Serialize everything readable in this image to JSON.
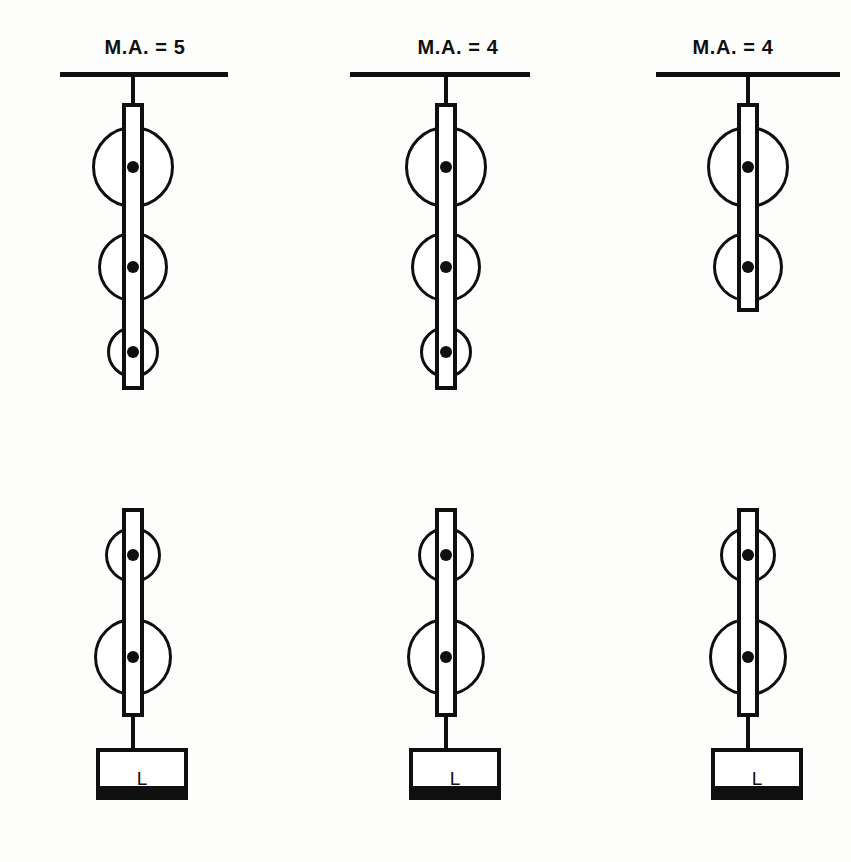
{
  "figure": {
    "type": "pulley-system-diagram",
    "background_color": "#fdfdfc",
    "line_color": "#100f0f",
    "columns": [
      {
        "id": "system-1",
        "label": "M.A. = 5",
        "mechanical_advantage": 5,
        "center_x": 133,
        "ceiling": {
          "x": 60,
          "width": 168,
          "y": 72
        },
        "top_block": {
          "sheave_count": 3,
          "sheave_diameters": [
            82,
            70,
            52
          ],
          "sheave_centers_y": [
            167,
            267,
            352
          ],
          "strap": {
            "top": 103,
            "bottom": 390,
            "width": 22
          }
        },
        "bottom_block": {
          "sheave_count": 2,
          "sheave_diameters": [
            56,
            78
          ],
          "sheave_centers_y": [
            555,
            657
          ],
          "strap": {
            "top": 508,
            "bottom": 717,
            "width": 22
          }
        },
        "load": {
          "label": "L",
          "box": {
            "x": 96,
            "y": 748,
            "width": 92,
            "height": 52
          },
          "base_height": 14
        }
      },
      {
        "id": "system-2",
        "label": "M.A. = 4",
        "mechanical_advantage": 4,
        "center_x": 446,
        "ceiling": {
          "x": 350,
          "width": 180,
          "y": 72
        },
        "top_block": {
          "sheave_count": 3,
          "sheave_diameters": [
            82,
            70,
            52
          ],
          "sheave_centers_y": [
            167,
            267,
            352
          ],
          "strap": {
            "top": 103,
            "bottom": 390,
            "width": 22
          }
        },
        "bottom_block": {
          "sheave_count": 2,
          "sheave_diameters": [
            56,
            78
          ],
          "sheave_centers_y": [
            555,
            657
          ],
          "strap": {
            "top": 508,
            "bottom": 717,
            "width": 22
          }
        },
        "load": {
          "label": "L",
          "box": {
            "x": 409,
            "y": 748,
            "width": 92,
            "height": 52
          },
          "base_height": 14
        }
      },
      {
        "id": "system-3",
        "label": "M.A. = 4",
        "mechanical_advantage": 4,
        "center_x": 748,
        "ceiling": {
          "x": 656,
          "width": 184,
          "y": 72
        },
        "top_block": {
          "sheave_count": 2,
          "sheave_diameters": [
            82,
            70
          ],
          "sheave_centers_y": [
            167,
            267
          ],
          "strap": {
            "top": 103,
            "bottom": 312,
            "width": 22
          }
        },
        "bottom_block": {
          "sheave_count": 2,
          "sheave_diameters": [
            56,
            78
          ],
          "sheave_centers_y": [
            555,
            657
          ],
          "strap": {
            "top": 508,
            "bottom": 717,
            "width": 22
          }
        },
        "load": {
          "label": "L",
          "box": {
            "x": 711,
            "y": 748,
            "width": 92,
            "height": 52
          },
          "base_height": 14
        }
      }
    ]
  }
}
